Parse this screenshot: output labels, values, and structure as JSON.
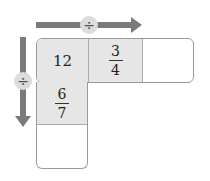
{
  "diagram": {
    "horizontal_operator": "÷",
    "vertical_operator": "÷",
    "arrow_color": "#7a7a7a",
    "cell_shade": "#e6e6e6",
    "grid": {
      "top_row": [
        "12",
        {
          "num": "3",
          "den": "4"
        },
        ""
      ],
      "left_column": [
        "12",
        {
          "num": "6",
          "den": "7"
        },
        ""
      ]
    },
    "cells": {
      "c00": "12",
      "c01_num": "3",
      "c01_den": "4",
      "c02": "",
      "c10_num": "6",
      "c10_den": "7",
      "c20": ""
    }
  }
}
